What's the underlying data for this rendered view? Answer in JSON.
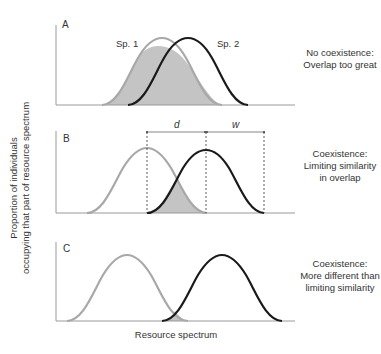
{
  "figure": {
    "y_axis_label": [
      "Proportion of individuals",
      "occupying that part of resource spectrum"
    ],
    "x_axis_label": "Resource spectrum",
    "colors": {
      "species1": "#a8a8a8",
      "species2": "#1a1a1a",
      "overlap_fill": "#c4c4c4",
      "axis": "#999999"
    }
  },
  "panels": [
    {
      "id": "A",
      "label": "A",
      "species_labels": [
        "Sp. 1",
        "Sp. 2"
      ],
      "note": [
        "No coexistence:",
        "Overlap too great"
      ]
    },
    {
      "id": "B",
      "label": "B",
      "distance_labels": {
        "d": "d",
        "w": "w"
      },
      "note": [
        "Coexistence:",
        "Limiting similarity",
        "in overlap"
      ]
    },
    {
      "id": "C",
      "label": "C",
      "note": [
        "Coexistence:",
        "More different than",
        "limiting similarity"
      ]
    }
  ]
}
